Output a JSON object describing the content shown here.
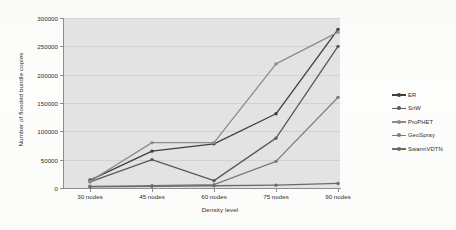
{
  "chart_data": {
    "type": "line",
    "title": "",
    "xlabel": "Density level",
    "ylabel": "Number of flooded bundle copies",
    "categories": [
      "30 nodes",
      "45 nodes",
      "60 nodes",
      "75 nodes",
      "90 nodes"
    ],
    "ylim": [
      0,
      300000
    ],
    "yticks": [
      0,
      50000,
      100000,
      150000,
      200000,
      250000,
      300000
    ],
    "ytick_labels": [
      "0",
      "50000",
      "100000",
      "150000",
      "200000",
      "250000",
      "300000"
    ],
    "grid": true,
    "legend_position": "right",
    "series": [
      {
        "name": "ER",
        "color": "#3f3f3f",
        "values": [
          14000,
          65000,
          78000,
          131000,
          280000
        ]
      },
      {
        "name": "SnW",
        "color": "#5a5a5a",
        "values": [
          11000,
          50000,
          13000,
          88000,
          250000
        ]
      },
      {
        "name": "ProPHET",
        "color": "#8c8c8c",
        "values": [
          12000,
          80000,
          80000,
          219000,
          275000
        ]
      },
      {
        "name": "GeoSpray",
        "color": "#7a7a7a",
        "values": [
          3000,
          4000,
          6000,
          47000,
          160000
        ]
      },
      {
        "name": "SwarmVDTN",
        "color": "#6b6b6b",
        "values": [
          2000,
          3000,
          4000,
          5000,
          8000
        ]
      }
    ]
  },
  "legend": {
    "items": [
      {
        "label": "ER"
      },
      {
        "label": "SnW"
      },
      {
        "label": "ProPHET"
      },
      {
        "label": "GeoSpray"
      },
      {
        "label": "SwarmVDTN"
      }
    ]
  }
}
